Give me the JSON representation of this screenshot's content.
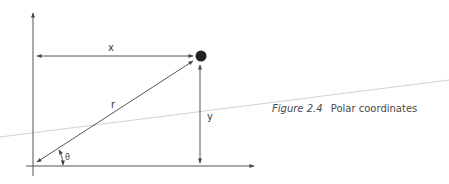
{
  "diagram": {
    "labels": {
      "x": "x",
      "y": "y",
      "r": "r",
      "theta": "θ"
    },
    "caption": {
      "figure_label": "Figure 2.4",
      "title": "Polar coordinates"
    },
    "colors": {
      "line": "#444444",
      "point": "#222222",
      "scan_line": "#b8b8b8",
      "background": "#ffffff"
    }
  }
}
